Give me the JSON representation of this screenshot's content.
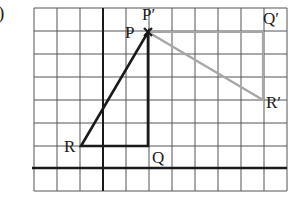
{
  "part_label": ")",
  "grid": {
    "x_lines": [
      34,
      57,
      80,
      103,
      126,
      149,
      172,
      195,
      218,
      241,
      264,
      287
    ],
    "y_lines": [
      8,
      31,
      54,
      77,
      100,
      123,
      146,
      168,
      191
    ],
    "y_axis_x": 103,
    "x_axis_y": 168
  },
  "colors": {
    "grid": "#555555",
    "axis": "#1a1a1a",
    "original_triangle": "#1a1a1a",
    "image_triangle": "#a6a6a6"
  },
  "original_triangle": {
    "name": "PQR",
    "vertices": [
      {
        "label": "P",
        "x": 148,
        "y": 32
      },
      {
        "label": "Q",
        "x": 148,
        "y": 146
      },
      {
        "label": "R",
        "x": 81,
        "y": 146
      }
    ]
  },
  "image_triangle": {
    "name": "P'Q'R'",
    "vertices": [
      {
        "label": "P′",
        "x": 148,
        "y": 32
      },
      {
        "label": "Q′",
        "x": 263,
        "y": 32
      },
      {
        "label": "R′",
        "x": 263,
        "y": 100
      }
    ]
  },
  "labels": {
    "P": "P",
    "P_prime": "P′",
    "Q": "Q",
    "Q_prime": "Q′",
    "R": "R",
    "R_prime": "R′"
  },
  "center_mark": "×"
}
